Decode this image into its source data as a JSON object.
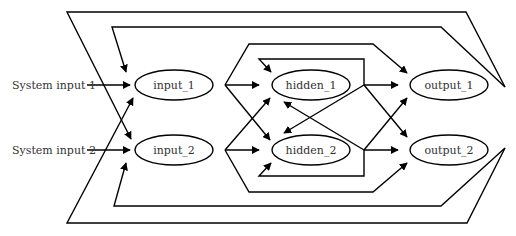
{
  "diagram": {
    "type": "directed-graph",
    "title": "",
    "colors": {
      "stroke": "#000000",
      "text": "#333333",
      "background": "#ffffff"
    },
    "system_inputs": [
      {
        "id": "sys1",
        "label": "System input 1",
        "target": "input_1"
      },
      {
        "id": "sys2",
        "label": "System input 2",
        "target": "input_2"
      }
    ],
    "nodes": [
      {
        "id": "input_1",
        "label": "input_1",
        "layer": "input"
      },
      {
        "id": "input_2",
        "label": "input_2",
        "layer": "input"
      },
      {
        "id": "hidden_1",
        "label": "hidden_1",
        "layer": "hidden"
      },
      {
        "id": "hidden_2",
        "label": "hidden_2",
        "layer": "hidden"
      },
      {
        "id": "output_1",
        "label": "output_1",
        "layer": "output"
      },
      {
        "id": "output_2",
        "label": "output_2",
        "layer": "output"
      }
    ],
    "edges": [
      {
        "from": "input_1",
        "to": "hidden_1"
      },
      {
        "from": "input_1",
        "to": "hidden_2"
      },
      {
        "from": "input_1",
        "to": "output_1"
      },
      {
        "from": "input_2",
        "to": "hidden_2"
      },
      {
        "from": "input_2",
        "to": "hidden_1"
      },
      {
        "from": "input_2",
        "to": "output_2"
      },
      {
        "from": "hidden_1",
        "to": "output_1"
      },
      {
        "from": "hidden_1",
        "to": "output_2"
      },
      {
        "from": "hidden_1",
        "to": "hidden_1"
      },
      {
        "from": "hidden_1",
        "to": "hidden_2"
      },
      {
        "from": "hidden_2",
        "to": "output_2"
      },
      {
        "from": "hidden_2",
        "to": "output_1"
      },
      {
        "from": "hidden_2",
        "to": "hidden_2"
      },
      {
        "from": "hidden_2",
        "to": "hidden_1"
      },
      {
        "from": "output_1",
        "to": "input_1"
      },
      {
        "from": "output_1",
        "to": "input_2"
      },
      {
        "from": "output_2",
        "to": "input_2"
      },
      {
        "from": "output_2",
        "to": "input_1"
      }
    ]
  }
}
